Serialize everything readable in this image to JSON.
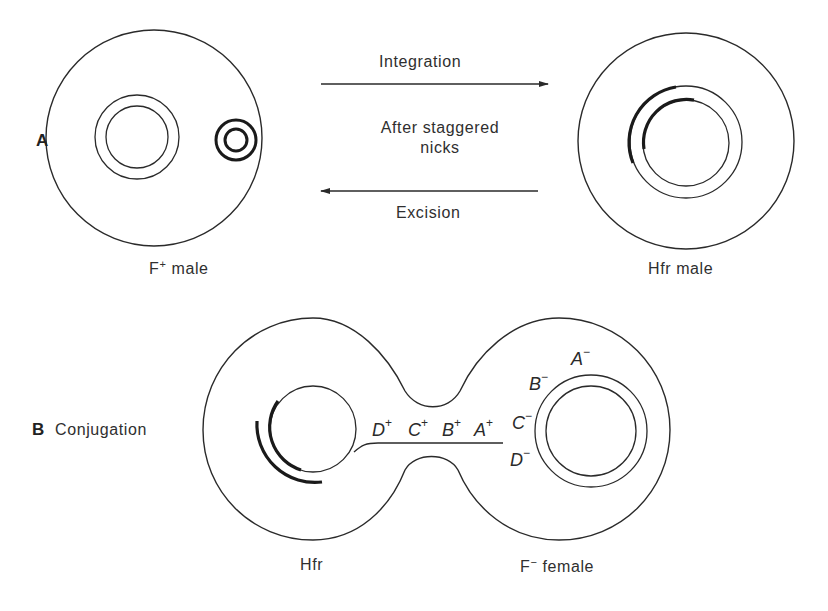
{
  "panel_a": {
    "letter": "A",
    "left_cell_label": "F",
    "left_cell_label_sup": "+",
    "left_cell_label_suffix": " male",
    "right_cell_label": "Hfr male",
    "arrow_forward_label": "Integration",
    "middle_label_line1": "After staggered",
    "middle_label_line2": "nicks",
    "arrow_back_label": "Excision"
  },
  "panel_b": {
    "letter": "B",
    "title": "Conjugation",
    "donor_label": "Hfr",
    "recipient_label": "F",
    "recipient_label_sup": "−",
    "recipient_label_suffix": " female",
    "donor_genes": [
      {
        "name": "D",
        "sup": "+"
      },
      {
        "name": "C",
        "sup": "+"
      },
      {
        "name": "B",
        "sup": "+"
      },
      {
        "name": "A",
        "sup": "+"
      }
    ],
    "recipient_genes": [
      {
        "name": "A",
        "sup": "−"
      },
      {
        "name": "B",
        "sup": "−"
      },
      {
        "name": "C",
        "sup": "−"
      },
      {
        "name": "D",
        "sup": "−"
      }
    ]
  },
  "colors": {
    "line": "#2a2a2a",
    "background": "#ffffff"
  }
}
